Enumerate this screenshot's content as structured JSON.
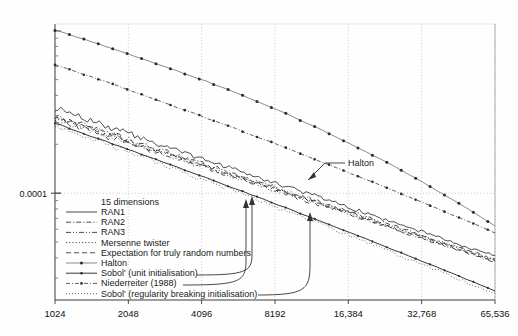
{
  "chart_data": {
    "type": "line",
    "title": "",
    "xlabel": "",
    "ylabel": "",
    "xscale": "log2",
    "yscale": "log10",
    "xlim": [
      1024,
      65536
    ],
    "ylim": [
      2.2e-05,
      0.0011
    ],
    "grid": true,
    "xticks": [
      1024,
      2048,
      4096,
      8192,
      16384,
      32768,
      65536
    ],
    "xtick_labels": [
      "1024",
      "2048",
      "4096",
      "8192",
      "16,384",
      "32,768",
      "65,536"
    ],
    "yticks": [
      0.0001
    ],
    "ytick_labels": [
      "0.0001"
    ],
    "legend_title": "15 dimensions",
    "legend_position": "lower-left",
    "series": [
      {
        "name": "RAN1",
        "style": "solid",
        "x": [
          1024,
          1448,
          2048,
          2896,
          4096,
          5793,
          8192,
          11585,
          16384,
          23170,
          32768,
          46341,
          65536
        ],
        "y": [
          0.00033,
          0.00028,
          0.000232,
          0.000196,
          0.000163,
          0.000138,
          0.000116,
          9.75e-05,
          8.2e-05,
          6.9e-05,
          5.8e-05,
          4.87e-05,
          4.1e-05
        ]
      },
      {
        "name": "RAN2",
        "style": "dash-dot",
        "x": [
          1024,
          1448,
          2048,
          2896,
          4096,
          5793,
          8192,
          11585,
          16384,
          23170,
          32768,
          46341,
          65536
        ],
        "y": [
          0.0003,
          0.000254,
          0.000215,
          0.000181,
          0.000153,
          0.000129,
          0.000109,
          9.18e-05,
          7.75e-05,
          6.53e-05,
          5.5e-05,
          4.63e-05,
          3.9e-05
        ]
      },
      {
        "name": "RAN3",
        "style": "dash-dot-dot",
        "x": [
          1024,
          1448,
          2048,
          2896,
          4096,
          5793,
          8192,
          11585,
          16384,
          23170,
          32768,
          46341,
          65536
        ],
        "y": [
          0.000285,
          0.000241,
          0.000204,
          0.000173,
          0.000146,
          0.000123,
          0.000104,
          8.8e-05,
          7.43e-05,
          6.27e-05,
          5.3e-05,
          4.47e-05,
          3.77e-05
        ]
      },
      {
        "name": "Mersenne twister",
        "style": "dotted",
        "x": [
          1024,
          1448,
          2048,
          2896,
          4096,
          5793,
          8192,
          11585,
          16384,
          23170,
          32768,
          46341,
          65536
        ],
        "y": [
          0.000292,
          0.000247,
          0.000209,
          0.000177,
          0.00015,
          0.000126,
          0.000107,
          9.03e-05,
          7.62e-05,
          6.43e-05,
          5.43e-05,
          4.58e-05,
          3.87e-05
        ]
      },
      {
        "name": "Expectation for truly random numbers",
        "style": "dashed",
        "x": [
          1024,
          1448,
          2048,
          2896,
          4096,
          5793,
          8192,
          11585,
          16384,
          23170,
          32768,
          46341,
          65536
        ],
        "y": [
          0.000296,
          0.000249,
          0.00021,
          0.000177,
          0.000149,
          0.000126,
          0.000106,
          8.94e-05,
          7.53e-05,
          6.35e-05,
          5.35e-05,
          4.51e-05,
          3.8e-05
        ]
      },
      {
        "name": "Halton",
        "style": "dot-marker",
        "x": [
          1024,
          1448,
          2048,
          2896,
          4096,
          5793,
          8192,
          11585,
          16384,
          23170,
          32768,
          46341,
          65536
        ],
        "y": [
          0.00101,
          0.000855,
          0.00072,
          0.0006,
          0.0005,
          0.00041,
          0.00033,
          0.000262,
          0.000204,
          0.000157,
          0.000118,
          8.7e-05,
          6.3e-05
        ]
      },
      {
        "name": "Sobol' (unit initialisation)",
        "style": "solid-marker",
        "x": [
          1024,
          1448,
          2048,
          2896,
          4096,
          5793,
          8192,
          11585,
          16384,
          23170,
          32768,
          46341,
          65536
        ],
        "y": [
          0.00027,
          0.000224,
          0.000186,
          0.000154,
          0.000127,
          0.000105,
          8.62e-05,
          7.06e-05,
          5.77e-05,
          4.7e-05,
          3.82e-05,
          3.1e-05,
          2.5e-05
        ]
      },
      {
        "name": "Niederreiter (1988)",
        "style": "dash-dot-marker",
        "x": [
          1024,
          1448,
          2048,
          2896,
          4096,
          5793,
          8192,
          11585,
          16384,
          23170,
          32768,
          46341,
          65536
        ],
        "y": [
          0.00062,
          0.00052,
          0.000434,
          0.00036,
          0.000298,
          0.000246,
          0.000202,
          0.000165,
          0.000134,
          0.000109,
          8.8e-05,
          7.1e-05,
          5.7e-05
        ]
      },
      {
        "name": "Sobol' (regularity breaking initialisation)",
        "style": "fine-dotted",
        "x": [
          1024,
          1448,
          2048,
          2896,
          4096,
          5793,
          8192,
          11585,
          16384,
          23170,
          32768,
          46341,
          65536
        ],
        "y": [
          0.000262,
          0.000217,
          0.00018,
          0.000148,
          0.000122,
          0.000101,
          8.26e-05,
          6.76e-05,
          5.52e-05,
          4.5e-05,
          3.66e-05,
          2.97e-05,
          2.41e-05
        ]
      }
    ],
    "annotations": [
      {
        "text": "Halton",
        "x": 20000,
        "y": 7.8e-05
      }
    ]
  },
  "legend": {
    "title": "15 dimensions",
    "items": [
      {
        "label": "RAN1",
        "style": "solid"
      },
      {
        "label": "RAN2",
        "style": "dash-dot"
      },
      {
        "label": "RAN3",
        "style": "dash-dot-dot"
      },
      {
        "label": "Mersenne twister",
        "style": "dotted"
      },
      {
        "label": "Expectation for truly random numbers",
        "style": "dashed"
      },
      {
        "label": "Halton",
        "style": "dot-marker"
      },
      {
        "label": "Sobol' (unit initialisation)",
        "style": "solid-marker"
      },
      {
        "label": "Niederreiter (1988)",
        "style": "dash-dot-marker"
      },
      {
        "label": "Sobol' (regularity breaking initialisation)",
        "style": "fine-dotted"
      }
    ]
  },
  "colors": {
    "axis": "#3a3a3a",
    "grid": "#bdbdbd",
    "curve": "#2b2b2b",
    "text": "#111111",
    "background": "#ffffff"
  }
}
